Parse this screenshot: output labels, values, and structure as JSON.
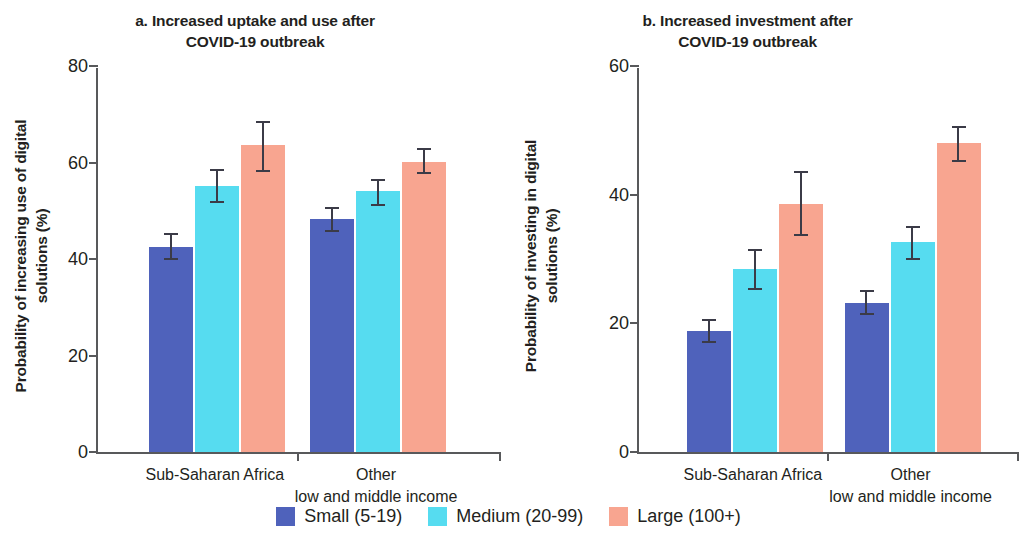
{
  "chart_data": [
    {
      "panel": "a",
      "type": "bar",
      "title": "a. Increased uptake and use after\nCOVID-19 outbreak",
      "xlabel": "",
      "ylabel": "Probability of increasing use of digital\nsolutions (%)",
      "ylim": [
        0,
        80
      ],
      "yticks": [
        0,
        20,
        40,
        60,
        80
      ],
      "ytick_labels": [
        "0",
        "20",
        "40",
        "60",
        "80"
      ],
      "grid": false,
      "legend_position": "bottom-center-shared",
      "categories": [
        "Sub-Saharan Africa",
        "Other\nlow and middle income"
      ],
      "series": [
        {
          "name": "Small (5-19)",
          "color": "#4f62bb",
          "values": [
            42.5,
            48.3
          ],
          "ci_low": [
            40.0,
            45.8
          ],
          "ci_high": [
            45.2,
            50.6
          ]
        },
        {
          "name": "Medium (20-99)",
          "color": "#56dcf0",
          "values": [
            55.2,
            54.2
          ],
          "ci_low": [
            51.8,
            51.3
          ],
          "ci_high": [
            58.4,
            56.5
          ]
        },
        {
          "name": "Large (100+)",
          "color": "#f8a590",
          "values": [
            63.7,
            60.2
          ],
          "ci_low": [
            58.2,
            57.8
          ],
          "ci_high": [
            68.5,
            62.8
          ]
        }
      ]
    },
    {
      "panel": "b",
      "type": "bar",
      "title": "b. Increased investment after\nCOVID-19 outbreak",
      "xlabel": "",
      "ylabel": "Probability of investing in digital\nsolutions (%)",
      "ylim": [
        0,
        60
      ],
      "yticks": [
        0,
        20,
        40,
        60
      ],
      "ytick_labels": [
        "0",
        "20",
        "40",
        "60"
      ],
      "grid": false,
      "legend_position": "bottom-center-shared",
      "categories": [
        "Sub-Saharan Africa",
        "Other\nlow and middle income"
      ],
      "series": [
        {
          "name": "Small (5-19)",
          "color": "#4f62bb",
          "values": [
            18.8,
            23.2
          ],
          "ci_low": [
            17.2,
            21.5
          ],
          "ci_high": [
            20.5,
            25.1
          ]
        },
        {
          "name": "Medium (20-99)",
          "color": "#56dcf0",
          "values": [
            28.5,
            32.6
          ],
          "ci_low": [
            25.4,
            30.0
          ],
          "ci_high": [
            31.5,
            35.0
          ]
        },
        {
          "name": "Large (100+)",
          "color": "#f8a590",
          "values": [
            38.6,
            48.0
          ],
          "ci_low": [
            33.8,
            45.2
          ],
          "ci_high": [
            43.6,
            50.6
          ]
        }
      ]
    }
  ],
  "panel_a": {
    "title": "a. Increased uptake and use after\nCOVID-19 outbreak",
    "ylabel": "Probability of increasing use of digital\nsolutions (%)",
    "ytick_0": "0",
    "ytick_1": "20",
    "ytick_2": "40",
    "ytick_3": "60",
    "ytick_4": "80",
    "xlabel_0": "Sub-Saharan Africa",
    "xlabel_1": "Other\nlow and middle income"
  },
  "panel_b": {
    "title": "b. Increased investment after\nCOVID-19 outbreak",
    "ylabel": "Probability of investing in digital\nsolutions (%)",
    "ytick_0": "0",
    "ytick_1": "20",
    "ytick_2": "40",
    "ytick_3": "60",
    "xlabel_0": "Sub-Saharan Africa",
    "xlabel_1": "Other\nlow and middle income"
  },
  "legend": {
    "items": [
      {
        "label": "Small (5-19)",
        "color": "#4f62bb"
      },
      {
        "label": "Medium (20-99)",
        "color": "#56dcf0"
      },
      {
        "label": "Large (100+)",
        "color": "#f8a590"
      }
    ]
  },
  "colors": {
    "small": "#4f62bb",
    "medium": "#56dcf0",
    "large": "#f8a590",
    "axis": "#58595b",
    "error_bar": "#3b3b47",
    "text": "#231f20",
    "background": "#ffffff"
  }
}
